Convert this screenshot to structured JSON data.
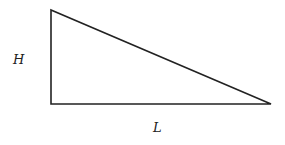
{
  "diagram": {
    "shape": "right-triangle",
    "vertices": [
      [
        51,
        10
      ],
      [
        51,
        104
      ],
      [
        271,
        104
      ]
    ],
    "stroke_color": "#222222",
    "labels": {
      "height": "H",
      "length": "L"
    }
  }
}
